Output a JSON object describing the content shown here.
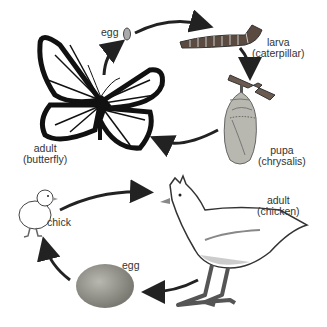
{
  "butterfly_cycle": {
    "egg": "egg",
    "larva_1": "larva",
    "larva_2": "(caterpillar)",
    "pupa_1": "pupa",
    "pupa_2": "(chrysalis)",
    "adult_1": "adult",
    "adult_2": "(butterfly)"
  },
  "chicken_cycle": {
    "chick": "chick",
    "egg": "egg",
    "adult_1": "adult",
    "adult_2": "(chicken)"
  },
  "colors": {
    "arrow": "#222222",
    "caterpillar": "#5a4a40",
    "chrysalis": "#b8b8b0",
    "egg": "#9a9a92"
  }
}
